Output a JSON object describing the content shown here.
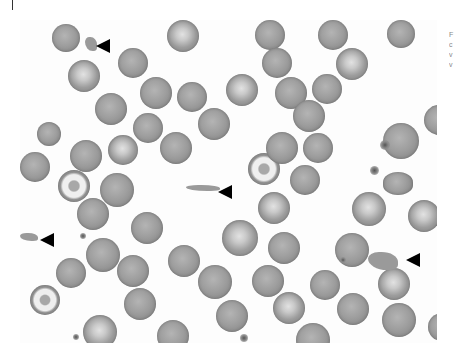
{
  "image": {
    "description": "Peripheral blood smear micrograph showing red blood cells with arrowheads pointing to fragments",
    "background": "#fdfdfd",
    "side_text_lines": [
      "F",
      "c",
      "v",
      "v"
    ]
  },
  "cells": [
    {
      "x": 32,
      "y": 4,
      "d": 28,
      "type": "normal"
    },
    {
      "x": 147,
      "y": 0,
      "d": 32,
      "type": "pale"
    },
    {
      "x": 235,
      "y": 0,
      "d": 30,
      "type": "normal"
    },
    {
      "x": 298,
      "y": 0,
      "d": 30,
      "type": "normal"
    },
    {
      "x": 367,
      "y": 0,
      "d": 28,
      "type": "normal"
    },
    {
      "x": 48,
      "y": 40,
      "d": 32,
      "type": "pale"
    },
    {
      "x": 98,
      "y": 28,
      "d": 30,
      "type": "normal"
    },
    {
      "x": 242,
      "y": 28,
      "d": 30,
      "type": "normal"
    },
    {
      "x": 316,
      "y": 28,
      "d": 32,
      "type": "pale"
    },
    {
      "x": 75,
      "y": 73,
      "d": 32,
      "type": "normal"
    },
    {
      "x": 120,
      "y": 57,
      "d": 32,
      "type": "normal"
    },
    {
      "x": 157,
      "y": 62,
      "d": 30,
      "type": "normal"
    },
    {
      "x": 206,
      "y": 54,
      "d": 32,
      "type": "pale"
    },
    {
      "x": 255,
      "y": 57,
      "d": 32,
      "type": "normal"
    },
    {
      "x": 292,
      "y": 54,
      "d": 30,
      "type": "normal"
    },
    {
      "x": 17,
      "y": 102,
      "d": 24,
      "type": "normal"
    },
    {
      "x": 113,
      "y": 93,
      "d": 30,
      "type": "normal"
    },
    {
      "x": 178,
      "y": 88,
      "d": 32,
      "type": "normal"
    },
    {
      "x": 273,
      "y": 80,
      "d": 32,
      "type": "normal"
    },
    {
      "x": 50,
      "y": 120,
      "d": 32,
      "type": "normal"
    },
    {
      "x": 88,
      "y": 115,
      "d": 30,
      "type": "pale"
    },
    {
      "x": 140,
      "y": 112,
      "d": 32,
      "type": "normal"
    },
    {
      "x": 228,
      "y": 133,
      "d": 32,
      "type": "target"
    },
    {
      "x": 246,
      "y": 112,
      "d": 32,
      "type": "normal"
    },
    {
      "x": 283,
      "y": 113,
      "d": 30,
      "type": "normal"
    },
    {
      "x": 363,
      "y": 103,
      "d": 36,
      "type": "normal"
    },
    {
      "x": 404,
      "y": 85,
      "d": 30,
      "type": "normal"
    },
    {
      "x": 38,
      "y": 150,
      "d": 32,
      "type": "target"
    },
    {
      "x": 80,
      "y": 153,
      "d": 34,
      "type": "normal"
    },
    {
      "x": 270,
      "y": 145,
      "d": 30,
      "type": "normal"
    },
    {
      "x": 0,
      "y": 132,
      "d": 30,
      "type": "normal"
    },
    {
      "x": 238,
      "y": 172,
      "d": 32,
      "type": "pale"
    },
    {
      "x": 332,
      "y": 172,
      "d": 34,
      "type": "pale"
    },
    {
      "x": 363,
      "y": 152,
      "d": 30,
      "type": "oval"
    },
    {
      "x": 57,
      "y": 178,
      "d": 32,
      "type": "normal"
    },
    {
      "x": 111,
      "y": 192,
      "d": 32,
      "type": "normal"
    },
    {
      "x": 202,
      "y": 200,
      "d": 36,
      "type": "pale"
    },
    {
      "x": 248,
      "y": 212,
      "d": 32,
      "type": "normal"
    },
    {
      "x": 388,
      "y": 180,
      "d": 32,
      "type": "pale"
    },
    {
      "x": 66,
      "y": 218,
      "d": 34,
      "type": "normal"
    },
    {
      "x": 97,
      "y": 235,
      "d": 32,
      "type": "normal"
    },
    {
      "x": 148,
      "y": 225,
      "d": 32,
      "type": "normal"
    },
    {
      "x": 315,
      "y": 213,
      "d": 34,
      "type": "normal"
    },
    {
      "x": 36,
      "y": 238,
      "d": 30,
      "type": "normal"
    },
    {
      "x": 178,
      "y": 245,
      "d": 34,
      "type": "normal"
    },
    {
      "x": 232,
      "y": 245,
      "d": 32,
      "type": "normal"
    },
    {
      "x": 290,
      "y": 250,
      "d": 30,
      "type": "normal"
    },
    {
      "x": 358,
      "y": 248,
      "d": 32,
      "type": "pale"
    },
    {
      "x": 10,
      "y": 265,
      "d": 30,
      "type": "target"
    },
    {
      "x": 104,
      "y": 268,
      "d": 32,
      "type": "normal"
    },
    {
      "x": 196,
      "y": 280,
      "d": 32,
      "type": "normal"
    },
    {
      "x": 253,
      "y": 272,
      "d": 32,
      "type": "pale"
    },
    {
      "x": 317,
      "y": 273,
      "d": 32,
      "type": "normal"
    },
    {
      "x": 362,
      "y": 283,
      "d": 34,
      "type": "normal"
    },
    {
      "x": 63,
      "y": 295,
      "d": 34,
      "type": "pale"
    },
    {
      "x": 137,
      "y": 300,
      "d": 32,
      "type": "normal"
    },
    {
      "x": 276,
      "y": 303,
      "d": 34,
      "type": "normal"
    },
    {
      "x": 408,
      "y": 293,
      "d": 28,
      "type": "normal"
    }
  ],
  "platelets": [
    {
      "x": 360,
      "y": 120,
      "d": 10
    },
    {
      "x": 350,
      "y": 146,
      "d": 9
    },
    {
      "x": 53,
      "y": 314,
      "d": 6
    },
    {
      "x": 320,
      "y": 237,
      "d": 6
    },
    {
      "x": 220,
      "y": 314,
      "d": 8
    },
    {
      "x": 60,
      "y": 213,
      "d": 6
    }
  ],
  "fragments": [
    {
      "x": 65,
      "y": 17,
      "w": 12,
      "h": 14
    },
    {
      "x": 166,
      "y": 165,
      "w": 34,
      "h": 6
    },
    {
      "x": 0,
      "y": 213,
      "w": 18,
      "h": 8
    },
    {
      "x": 348,
      "y": 232,
      "w": 30,
      "h": 18
    }
  ],
  "arrows": [
    {
      "x": 76,
      "y": 19,
      "label": "arrowhead-1"
    },
    {
      "x": 198,
      "y": 165,
      "label": "arrowhead-2"
    },
    {
      "x": 20,
      "y": 213,
      "label": "arrowhead-3"
    },
    {
      "x": 386,
      "y": 233,
      "label": "arrowhead-4"
    }
  ]
}
